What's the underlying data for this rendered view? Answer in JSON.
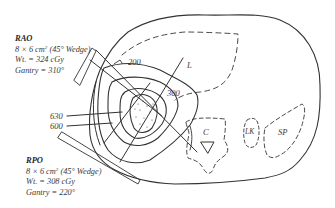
{
  "figure": {
    "type": "isodose treatment plan on axial cross-section",
    "beams": [
      {
        "name": "RAO",
        "field": "8 × 6 cm",
        "field_unit_sup": "2",
        "wedge": "(45° Wedge)",
        "weight": "Wt. = 324 cGy",
        "gantry": "Gantry = 310°"
      },
      {
        "name": "RPO",
        "field": "8 × 6 cm",
        "field_unit_sup": "2",
        "wedge": "(45° Wedge)",
        "weight": "Wt. = 308 cGy",
        "gantry": "Gantry = 220°"
      }
    ],
    "isodose_labels": [
      "200",
      "300",
      "600",
      "630"
    ],
    "organ_labels": {
      "liver": "L",
      "cord": "C",
      "left_kidney": "LK",
      "spleen": "SP"
    },
    "colors": {
      "line": "#333333",
      "text": "#3a3a3a",
      "background": "#ffffff"
    }
  }
}
